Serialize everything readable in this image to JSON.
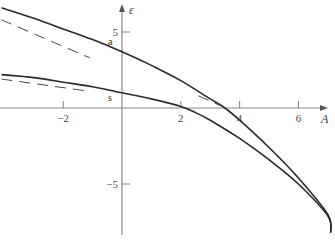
{
  "chart_data": {
    "type": "line",
    "title": "",
    "xlabel": "A",
    "ylabel": "ε",
    "xlim": [
      -4.1,
      7.3
    ],
    "ylim": [
      -8.4,
      7.1
    ],
    "grid": false,
    "legend": null,
    "x_ticks": [
      -2,
      2,
      4,
      6
    ],
    "x_tick_labels": [
      "−2",
      "2",
      "4",
      "6"
    ],
    "y_ticks": [
      5,
      -5
    ],
    "y_tick_labels": [
      "5",
      "−5"
    ],
    "series": [
      {
        "name": "a",
        "style": "solid",
        "label": "a",
        "x": [
          -4.1,
          -3,
          -2,
          -1,
          0,
          1,
          2,
          3,
          3.5,
          4,
          5,
          6,
          7,
          7.1
        ],
        "y": [
          6.6,
          5.9,
          5.2,
          4.5,
          3.7,
          2.8,
          1.8,
          0.6,
          0.0,
          -0.8,
          -2.6,
          -4.6,
          -7.0,
          -8.2
        ]
      },
      {
        "name": "s",
        "style": "solid",
        "label": "s",
        "x": [
          -4.1,
          -3,
          -2,
          -1,
          0,
          1,
          2,
          2.5,
          3,
          4,
          5,
          6,
          7,
          7.1
        ],
        "y": [
          2.2,
          2.0,
          1.7,
          1.4,
          1.0,
          0.6,
          0.1,
          -0.3,
          -0.8,
          -2.0,
          -3.4,
          -5.0,
          -7.1,
          -8.2
        ]
      },
      {
        "name": "a-asymptote",
        "style": "dashed",
        "x": [
          -4.1,
          -1.1
        ],
        "y": [
          5.8,
          3.3
        ]
      },
      {
        "name": "s-asymptote",
        "style": "dashed",
        "x": [
          -4.1,
          -1.1
        ],
        "y": [
          1.9,
          1.1
        ]
      },
      {
        "name": "large-A-asymptote",
        "style": "dashed",
        "x": [
          2.6,
          3.3
        ],
        "y": [
          0.8,
          0.2
        ]
      }
    ],
    "annotations": [
      {
        "text": "a",
        "x": -0.35,
        "y": 4.4
      },
      {
        "text": "s",
        "x": -0.35,
        "y": 0.7
      }
    ]
  }
}
